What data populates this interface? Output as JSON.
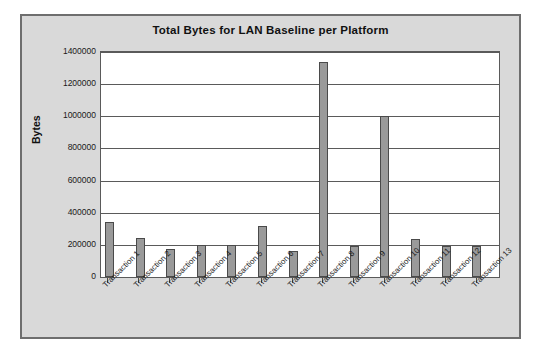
{
  "chart_data": {
    "type": "bar",
    "title": "Total Bytes for LAN Baseline per Platform",
    "xlabel": "",
    "ylabel": "Bytes",
    "ylim": [
      0,
      1400000
    ],
    "ytick_step": 200000,
    "ytick_labels": [
      "1400000",
      "1200000",
      "1000000",
      "800000",
      "600000",
      "400000",
      "200000",
      "0"
    ],
    "ytick_values": [
      1400000,
      1200000,
      1000000,
      800000,
      600000,
      400000,
      200000,
      0
    ],
    "grid": true,
    "legend": false,
    "categories": [
      "Transaction 1",
      "Transaction 2",
      "Transaction 3",
      "Transaction 4",
      "Transaction 5",
      "Transaction 6",
      "Transaction 7",
      "Transaction 8",
      "Transaction 9",
      "Transaction 10",
      "Transaction 11",
      "Transaction 12",
      "Transaction 13"
    ],
    "values": [
      340000,
      245000,
      175000,
      200000,
      200000,
      320000,
      160000,
      1335000,
      190000,
      1000000,
      235000,
      195000,
      195000
    ],
    "bar_color": "#9a9a9a",
    "bar_border_color": "#4a4a4a",
    "plot_background": "#ffffff",
    "chart_background": "#d9d9d9",
    "frame_border_color": "#6e6e6e"
  }
}
